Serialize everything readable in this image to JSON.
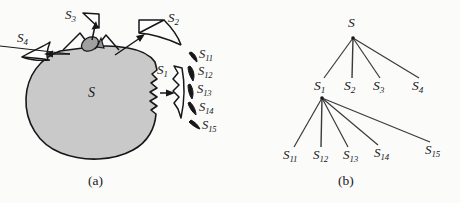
{
  "figure": {
    "panels": [
      {
        "caption": "(a)",
        "description": "Region S with separated pieces",
        "labels": {
          "whole": "S",
          "piece1": "S",
          "piece1_sub": "1",
          "piece2": "S",
          "piece2_sub": "2",
          "piece3": "S",
          "piece3_sub": "3",
          "piece4": "S",
          "piece4_sub": "4",
          "sub_pieces": [
            {
              "base": "S",
              "sub": "11"
            },
            {
              "base": "S",
              "sub": "12"
            },
            {
              "base": "S",
              "sub": "13"
            },
            {
              "base": "S",
              "sub": "14"
            },
            {
              "base": "S",
              "sub": "15"
            }
          ]
        }
      },
      {
        "caption": "(b)",
        "description": "Decomposition tree of S",
        "tree": {
          "root": {
            "base": "S",
            "sub": ""
          },
          "level1": [
            {
              "base": "S",
              "sub": "1"
            },
            {
              "base": "S",
              "sub": "2"
            },
            {
              "base": "S",
              "sub": "3"
            },
            {
              "base": "S",
              "sub": "4"
            }
          ],
          "level2_parent": {
            "base": "S",
            "sub": "1"
          },
          "level2": [
            {
              "base": "S",
              "sub": "11"
            },
            {
              "base": "S",
              "sub": "12"
            },
            {
              "base": "S",
              "sub": "13"
            },
            {
              "base": "S",
              "sub": "14"
            },
            {
              "base": "S",
              "sub": "15"
            }
          ]
        }
      }
    ],
    "colors": {
      "background": "#fbfbfa",
      "region_fill": "#c9c9c9",
      "piece_fill": "#a8a8a8",
      "outline": "#17171a",
      "text": "#17171a"
    }
  }
}
